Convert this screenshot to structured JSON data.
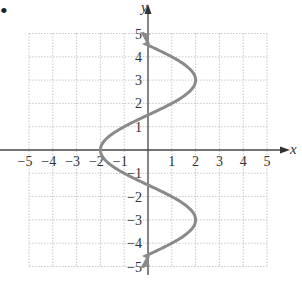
{
  "bullet": "•",
  "chart_data": {
    "type": "line",
    "title": "",
    "xlabel": "x",
    "ylabel": "y",
    "xlim": [
      -5,
      5
    ],
    "ylim": [
      -5,
      5
    ],
    "grid": true,
    "x_ticks": [
      "−5",
      "−4",
      "−3",
      "−2",
      "−1",
      "1",
      "2",
      "3",
      "4",
      "5"
    ],
    "y_ticks": [
      "5",
      "4",
      "3",
      "2",
      "1",
      "−1",
      "−2",
      "−3",
      "−4",
      "−5"
    ],
    "series": [
      {
        "name": "curve",
        "color": "#808080",
        "points": [
          [
            -0.2,
            5
          ],
          [
            2,
            3
          ],
          [
            0,
            1.5
          ],
          [
            -2,
            0
          ],
          [
            0,
            -1.5
          ],
          [
            2,
            -3
          ],
          [
            -0.2,
            -5
          ]
        ]
      }
    ]
  }
}
